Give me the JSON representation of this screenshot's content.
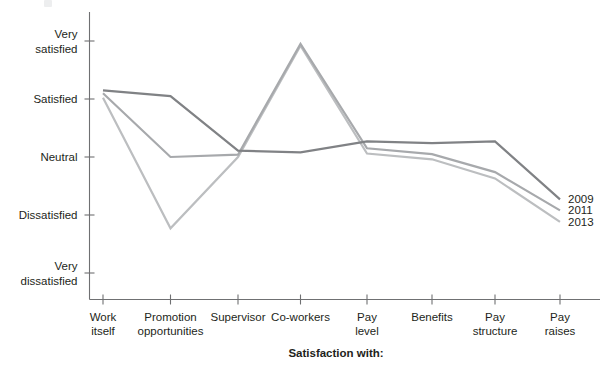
{
  "chart_data": {
    "type": "line",
    "title": "",
    "xlabel": "Satisfaction with:",
    "ylabel": "",
    "categories": [
      "Work itself",
      "Promotion opportunities",
      "Supervisor",
      "Co-workers",
      "Pay level",
      "Benefits",
      "Pay structure",
      "Pay raises"
    ],
    "category_lines": [
      [
        "Work",
        "itself"
      ],
      [
        "Promotion",
        "opportunities"
      ],
      [
        "Supervisor",
        ""
      ],
      [
        "Co-workers",
        ""
      ],
      [
        "Pay",
        "level"
      ],
      [
        "Benefits",
        ""
      ],
      [
        "Pay",
        "structure"
      ],
      [
        "Pay",
        "raises"
      ]
    ],
    "y_tick_labels": [
      [
        "Very",
        "satisfied"
      ],
      [
        "Satisfied",
        ""
      ],
      [
        "Neutral",
        ""
      ],
      [
        "Dissatisfied",
        ""
      ],
      [
        "Very",
        "dissatisfied"
      ]
    ],
    "y_scale": [
      "Very dissatisfied",
      "Dissatisfied",
      "Neutral",
      "Satisfied",
      "Very satisfied"
    ],
    "ylim": [
      1,
      5
    ],
    "grid": false,
    "legend_position": "right-inline",
    "series": [
      {
        "name": "2009",
        "color": "#808285",
        "values": [
          4.15,
          4.05,
          3.11,
          3.08,
          3.27,
          3.24,
          3.27,
          2.27
        ]
      },
      {
        "name": "2011",
        "color": "#a7a9ac",
        "values": [
          4.1,
          3.0,
          3.04,
          4.95,
          3.15,
          3.05,
          2.74,
          2.08
        ]
      },
      {
        "name": "2013",
        "color": "#bcbec0",
        "values": [
          4.02,
          1.77,
          3.0,
          4.92,
          3.06,
          2.96,
          2.63,
          1.88
        ]
      }
    ]
  },
  "axis": {
    "x_caption": "Satisfaction with:"
  },
  "legend": {
    "entries": [
      {
        "label": "2009"
      },
      {
        "label": "2011"
      },
      {
        "label": "2013"
      }
    ]
  }
}
